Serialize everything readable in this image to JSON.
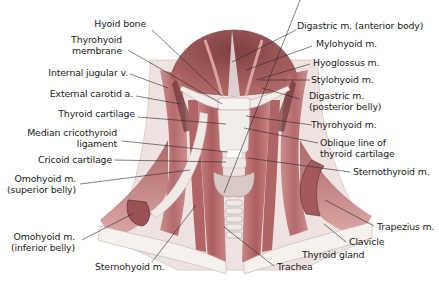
{
  "figure": {
    "colors": {
      "muscle": "#b9686a",
      "muscle_dark": "#8e4a4d",
      "muscle_light": "#d99a98",
      "bone": "#f1ece6",
      "cartilage": "#e9e4e2",
      "leader_line": "#2a2a2a",
      "text": "#1c1c1c"
    }
  },
  "labels_left": [
    {
      "id": "hyoid-bone",
      "lines": [
        "Hyoid bone"
      ]
    },
    {
      "id": "thyrohyoid-membrane",
      "lines": [
        "Thyrohyoid",
        "membrane"
      ]
    },
    {
      "id": "internal-jugular-v",
      "lines": [
        "Internal jugular v."
      ]
    },
    {
      "id": "external-carotid-a",
      "lines": [
        "External carotid a."
      ]
    },
    {
      "id": "thyroid-cartilage",
      "lines": [
        "Thyroid cartilage"
      ]
    },
    {
      "id": "median-cricothyroid-ligament",
      "lines": [
        "Median cricothyroid",
        "ligament"
      ]
    },
    {
      "id": "cricoid-cartilage",
      "lines": [
        "Cricoid cartilage"
      ]
    },
    {
      "id": "omohyoid-superior",
      "lines": [
        "Omohyoid m.",
        "(superior belly)"
      ]
    },
    {
      "id": "omohyoid-inferior",
      "lines": [
        "Omohyoid m.",
        "(inferior belly)"
      ]
    },
    {
      "id": "sternohyoid",
      "lines": [
        "Sternohyoid m."
      ]
    }
  ],
  "labels_right": [
    {
      "id": "digastric-anterior",
      "lines": [
        "Digastric m. (anterior body)"
      ]
    },
    {
      "id": "mylohyoid",
      "lines": [
        "Mylohyoid m."
      ]
    },
    {
      "id": "hyoglossus",
      "lines": [
        "Hyoglossus m."
      ]
    },
    {
      "id": "stylohyoid",
      "lines": [
        "Stylohyoid m."
      ]
    },
    {
      "id": "digastric-posterior",
      "lines": [
        "Digastric m.",
        "(posterior belly)"
      ]
    },
    {
      "id": "thyrohyoid",
      "lines": [
        "Thyrohyoid m."
      ]
    },
    {
      "id": "oblique-line",
      "lines": [
        "Oblique line of",
        "thyroid cartilage"
      ]
    },
    {
      "id": "sternothyroid",
      "lines": [
        "Sternothyroid m."
      ]
    },
    {
      "id": "trapezius",
      "lines": [
        "Trapezius m."
      ]
    },
    {
      "id": "clavicle",
      "lines": [
        "Clavicle"
      ]
    },
    {
      "id": "thyroid-gland",
      "lines": [
        "Thyroid gland"
      ]
    },
    {
      "id": "trachea",
      "lines": [
        "Trachea"
      ]
    }
  ]
}
